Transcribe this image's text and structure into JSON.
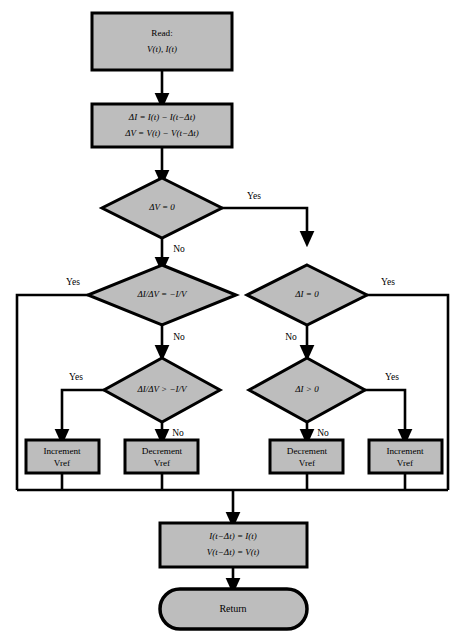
{
  "diagram": {
    "type": "flowchart",
    "fill_color": "#bdbdbd",
    "line_color": "#000000",
    "background_color": "#ffffff"
  },
  "nodes": {
    "read": {
      "shape": "process",
      "line1": "Read:",
      "line2": "V(t), I(t)"
    },
    "deltas": {
      "shape": "process",
      "line1": "ΔI = I(t) − I(t−Δt)",
      "line2": "ΔV = V(t) − V(t−Δt)"
    },
    "decision_dv": {
      "shape": "decision",
      "text": "ΔV = 0"
    },
    "decision_cond_eq": {
      "shape": "decision",
      "text": "ΔI/ΔV = −I/V"
    },
    "decision_di_eq": {
      "shape": "decision",
      "text": "ΔI = 0"
    },
    "decision_cond_gt": {
      "shape": "decision",
      "text": "ΔI/ΔV > −I/V"
    },
    "decision_di_gt": {
      "shape": "decision",
      "text": "ΔI > 0"
    },
    "action_inc_left": {
      "shape": "process",
      "line1": "Increment",
      "line2": "Vref"
    },
    "action_dec_left": {
      "shape": "process",
      "line1": "Decrement",
      "line2": "Vref"
    },
    "action_dec_right": {
      "shape": "process",
      "line1": "Decrement",
      "line2": "Vref"
    },
    "action_inc_right": {
      "shape": "process",
      "line1": "Increment",
      "line2": "Vref"
    },
    "update": {
      "shape": "process",
      "line1": "I(t−Δt) = I(t)",
      "line2": "V(t−Δt) = V(t)"
    },
    "return": {
      "shape": "terminator",
      "text": "Return"
    }
  },
  "branch_labels": {
    "dv_yes": "Yes",
    "dv_no": "No",
    "cond_eq_yes": "Yes",
    "cond_eq_no": "No",
    "di_eq_yes": "Yes",
    "di_eq_no": "No",
    "cond_gt_yes": "Yes",
    "cond_gt_no": "No",
    "di_gt_yes": "Yes",
    "di_gt_no": "No"
  },
  "captions": {
    "top": "",
    "bottom": ""
  }
}
